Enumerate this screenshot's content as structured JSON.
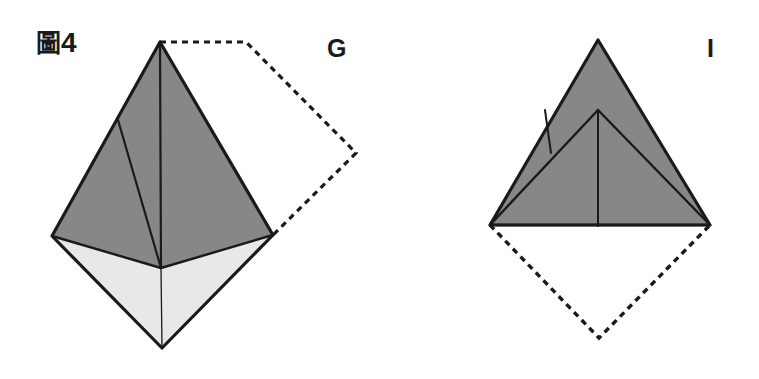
{
  "page": {
    "width": 759,
    "height": 379,
    "background_color": "#ffffff",
    "caption_prefix": "圖",
    "figure_number": "4",
    "figure_label_full": "圖4"
  },
  "colors": {
    "stroke": "#1a1a1a",
    "shaded_face": "#878787",
    "light_face": "#e8e8e8",
    "white_face": "#ffffff",
    "dashed_stroke": "#1a1a1a",
    "label_text": "#1a1a1a"
  },
  "panels": [
    {
      "id": "panel-g",
      "label": "G",
      "label_position": {
        "x": 327,
        "y": 36
      },
      "description": "origami-fold-step-g",
      "solid_outline": [
        {
          "x": 160,
          "y": 42
        },
        {
          "x": 273,
          "y": 235
        },
        {
          "x": 162,
          "y": 348
        },
        {
          "x": 52,
          "y": 236
        }
      ],
      "shaded_faces": [
        {
          "name": "upper-right-shaded-face",
          "fill": "#878787",
          "points": [
            {
              "x": 160,
              "y": 42
            },
            {
              "x": 273,
              "y": 235
            },
            {
              "x": 161,
              "y": 268
            }
          ]
        },
        {
          "name": "upper-left-shaded-face",
          "fill": "#878787",
          "points": [
            {
              "x": 160,
              "y": 42
            },
            {
              "x": 161,
              "y": 268
            },
            {
              "x": 52,
              "y": 236
            },
            {
              "x": 118,
              "y": 120
            }
          ]
        }
      ],
      "light_faces": [
        {
          "name": "lower-left-light-face",
          "fill": "#e8e8e8",
          "points": [
            {
              "x": 52,
              "y": 236
            },
            {
              "x": 161,
              "y": 268
            },
            {
              "x": 162,
              "y": 348
            }
          ]
        },
        {
          "name": "lower-right-light-face",
          "fill": "#e8e8e8",
          "points": [
            {
              "x": 161,
              "y": 268
            },
            {
              "x": 273,
              "y": 235
            },
            {
              "x": 162,
              "y": 348
            }
          ]
        }
      ],
      "fold_lines": [
        {
          "name": "center-vertical-fold",
          "from": {
            "x": 160,
            "y": 42
          },
          "to": {
            "x": 161,
            "y": 268
          },
          "width": 2.2
        },
        {
          "name": "left-edge-fold",
          "from": {
            "x": 118,
            "y": 120
          },
          "to": {
            "x": 161,
            "y": 268
          },
          "width": 2.2
        },
        {
          "name": "bottom-center-fold",
          "from": {
            "x": 161,
            "y": 268
          },
          "to": {
            "x": 162,
            "y": 348
          },
          "width": 1.3
        },
        {
          "name": "horizontal-fold-left",
          "from": {
            "x": 52,
            "y": 236
          },
          "to": {
            "x": 161,
            "y": 268
          },
          "width": 2.4
        },
        {
          "name": "horizontal-fold-right",
          "from": {
            "x": 161,
            "y": 268
          },
          "to": {
            "x": 273,
            "y": 235
          },
          "width": 2.4
        }
      ],
      "dashed_path": {
        "name": "ghost-outline-folded-away",
        "points": [
          {
            "x": 160,
            "y": 42
          },
          {
            "x": 246,
            "y": 42
          },
          {
            "x": 356,
            "y": 153
          },
          {
            "x": 273,
            "y": 235
          }
        ],
        "dash": "6 5",
        "width": 3.2
      }
    },
    {
      "id": "panel-i",
      "label": "I",
      "label_position": {
        "x": 707,
        "y": 36
      },
      "description": "origami-fold-step-i",
      "solid_outline": [
        {
          "x": 598,
          "y": 40
        },
        {
          "x": 710,
          "y": 225
        },
        {
          "x": 490,
          "y": 225
        }
      ],
      "shaded_faces": [
        {
          "name": "main-triangle-shaded-face",
          "fill": "#878787",
          "points": [
            {
              "x": 598,
              "y": 40
            },
            {
              "x": 710,
              "y": 225
            },
            {
              "x": 490,
              "y": 225
            }
          ]
        }
      ],
      "light_faces": [],
      "fold_lines": [
        {
          "name": "inner-peak-left-fold",
          "from": {
            "x": 490,
            "y": 225
          },
          "to": {
            "x": 598,
            "y": 110
          },
          "width": 2.4
        },
        {
          "name": "inner-peak-right-fold",
          "from": {
            "x": 598,
            "y": 110
          },
          "to": {
            "x": 710,
            "y": 225
          },
          "width": 2.4
        },
        {
          "name": "inner-center-vertical-fold",
          "from": {
            "x": 598,
            "y": 110
          },
          "to": {
            "x": 598,
            "y": 226
          },
          "width": 2.0
        },
        {
          "name": "small-left-flap-fold",
          "from": {
            "x": 545,
            "y": 110
          },
          "to": {
            "x": 551,
            "y": 153
          },
          "width": 2.0
        },
        {
          "name": "base-horizontal-edge",
          "from": {
            "x": 490,
            "y": 225
          },
          "to": {
            "x": 710,
            "y": 225
          },
          "width": 2.4
        }
      ],
      "dashed_path": {
        "name": "ghost-outline-folded-away",
        "points": [
          {
            "x": 490,
            "y": 225
          },
          {
            "x": 599,
            "y": 338
          },
          {
            "x": 710,
            "y": 225
          }
        ],
        "dash": "6 5",
        "width": 3.4
      }
    }
  ]
}
